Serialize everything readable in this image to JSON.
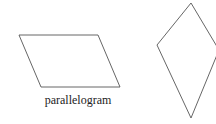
{
  "shapes": {
    "parallelogram": {
      "label": "parallelogram",
      "points": "19,35 98,35 120,87 41,87",
      "stroke": "#555555"
    },
    "kite": {
      "points": "191,3 219,50 191,118 157,45",
      "stroke": "#555555"
    }
  }
}
